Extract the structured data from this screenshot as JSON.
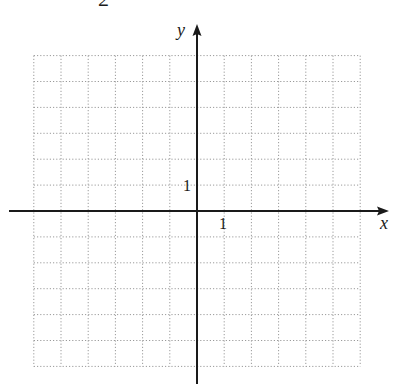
{
  "header": {
    "partial_text": "2"
  },
  "axes": {
    "x_label": "x",
    "y_label": "y",
    "x_tick_label": "1",
    "y_tick_label": "1"
  },
  "grid": {
    "x_min": -6,
    "x_max": 6,
    "y_min": -6,
    "y_max": 6,
    "unit": 1,
    "line_style": "dotted",
    "line_color": "#9a9a9a",
    "axis_color": "#1a1a1a"
  },
  "chart_data": {
    "type": "scatter",
    "title": "",
    "xlabel": "x",
    "ylabel": "y",
    "xlim": [
      -6,
      6
    ],
    "ylim": [
      -6,
      6
    ],
    "grid": true,
    "tick_labels": {
      "x": [
        "1"
      ],
      "y": [
        "1"
      ]
    },
    "series": []
  }
}
